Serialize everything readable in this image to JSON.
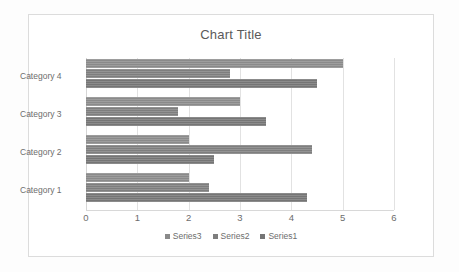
{
  "chart_data": {
    "type": "bar",
    "orientation": "horizontal",
    "title": "Chart Title",
    "xlabel": "",
    "ylabel": "",
    "categories": [
      "Category 1",
      "Category 2",
      "Category 3",
      "Category 4"
    ],
    "series": [
      {
        "name": "Series1",
        "values": [
          4.3,
          2.5,
          3.5,
          4.5
        ],
        "color": "#757575"
      },
      {
        "name": "Series2",
        "values": [
          2.4,
          4.4,
          1.8,
          2.8
        ],
        "color": "#7e7e7e"
      },
      {
        "name": "Series3",
        "values": [
          2.0,
          2.0,
          3.0,
          5.0
        ],
        "color": "#8a8a8a"
      }
    ],
    "xlim": [
      0,
      6
    ],
    "xticks": [
      0,
      1,
      2,
      3,
      4,
      5,
      6
    ],
    "xtick_labels": [
      "0",
      "1",
      "2",
      "3",
      "4",
      "5",
      "6"
    ],
    "grid": true,
    "grid_axis": "x",
    "legend": [
      "Series3",
      "Series2",
      "Series1"
    ],
    "legend_position": "bottom",
    "bar_order_top_to_bottom": [
      "Series3",
      "Series2",
      "Series1"
    ],
    "category_order_top_to_bottom": [
      "Category 4",
      "Category 3",
      "Category 2",
      "Category 1"
    ]
  },
  "colors": {
    "background": "#ffffff",
    "frame_border": "#dcdcdc",
    "gridline": "#e2e2e2",
    "axis_text": "#6d6d6d",
    "title_text": "#5a5a5a"
  }
}
